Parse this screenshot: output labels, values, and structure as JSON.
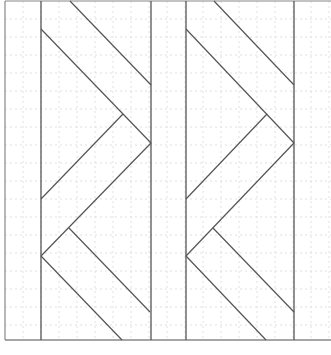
{
  "diagram": {
    "title": "",
    "type": "quilt-block-line-pattern",
    "width": 331,
    "height": 355,
    "colors": {
      "background": "#ffffff",
      "line": "#555555",
      "frame": "#888888",
      "grid": "#d8d8d8"
    },
    "frame": {
      "x1": 5,
      "y1": 1,
      "x2": 331,
      "y2": 340
    },
    "grid_spacing": 18,
    "vertical_lines": [
      41,
      151,
      186,
      294
    ],
    "panels": [
      {
        "name": "left-panel",
        "segments": [
          [
            70,
            1,
            151,
            85
          ],
          [
            41,
            29,
            151,
            143
          ],
          [
            123,
            114,
            41,
            199
          ],
          [
            151,
            143,
            41,
            256
          ],
          [
            69,
            228,
            150,
            312
          ],
          [
            41,
            256,
            122,
            340
          ]
        ]
      },
      {
        "name": "right-panel",
        "segments": [
          [
            214,
            1,
            294,
            85
          ],
          [
            186,
            29,
            294,
            143
          ],
          [
            267,
            114,
            186,
            199
          ],
          [
            294,
            143,
            186,
            256
          ],
          [
            213,
            228,
            294,
            312
          ],
          [
            186,
            256,
            266,
            340
          ]
        ]
      }
    ]
  }
}
